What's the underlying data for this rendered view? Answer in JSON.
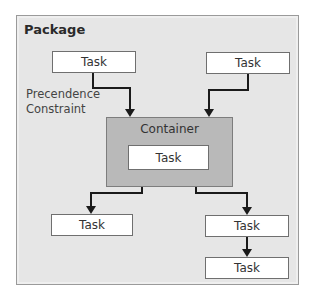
{
  "package": {
    "title": "Package"
  },
  "precedence_label": {
    "line1": "Precendence",
    "line2": "Constraint"
  },
  "container": {
    "label": "Container",
    "inner_task": "Task"
  },
  "tasks": [
    {
      "id": "top-left",
      "label": "Task"
    },
    {
      "id": "top-right",
      "label": "Task"
    },
    {
      "id": "bottom-left",
      "label": "Task"
    },
    {
      "id": "bottom-right-1",
      "label": "Task"
    },
    {
      "id": "bottom-right-2",
      "label": "Task"
    }
  ],
  "colors": {
    "package_bg": "#e6e6e6",
    "container_bg": "#b9b9b9",
    "task_bg": "#ffffff",
    "connector": "#1a1a1a"
  }
}
